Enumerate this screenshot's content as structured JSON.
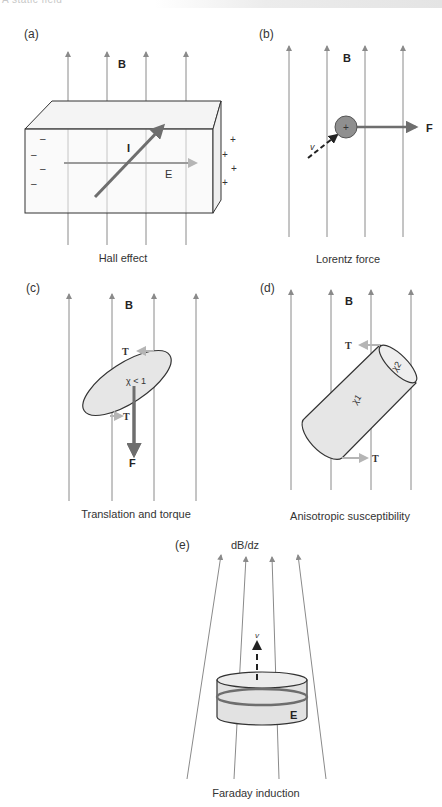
{
  "header": {
    "text": "A static field"
  },
  "panels": {
    "a": {
      "tag": "(a)",
      "caption": "Hall effect",
      "field_label": "B",
      "current_label": "I",
      "efield_label": "E",
      "neg_signs": [
        "–",
        "–",
        "–",
        "–"
      ],
      "pos_signs": [
        "+",
        "+",
        "+",
        "+"
      ]
    },
    "b": {
      "tag": "(b)",
      "caption": "Lorentz force",
      "field_label": "B",
      "velocity_label": "v",
      "force_label": "F",
      "charge_sign": "+"
    },
    "c": {
      "tag": "(c)",
      "caption": "Translation and torque",
      "field_label": "B",
      "susceptibility_label": "χ < 1",
      "torque_label_top": "T",
      "torque_label_bottom": "T",
      "force_label": "F"
    },
    "d": {
      "tag": "(d)",
      "caption": "Anisotropic susceptibility",
      "field_label": "B",
      "chi1_label": "χ1",
      "chi2_label": "χ2",
      "torque_label_top": "T",
      "torque_label_bottom": "T"
    },
    "e": {
      "tag": "(e)",
      "caption": "Faraday induction",
      "field_label": "dB/dz",
      "velocity_label": "v",
      "efield_label": "E"
    }
  },
  "colors": {
    "field_line": "#8a8a8a",
    "arrow_dark": "#6e6e6e",
    "arrow_light": "#b5b5b5",
    "fill_light": "#e6e6e6",
    "outline": "#333333"
  }
}
